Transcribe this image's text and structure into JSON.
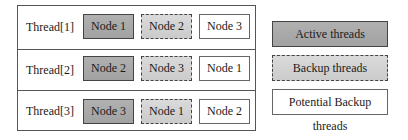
{
  "diagram": {
    "title": "",
    "threads": [
      {
        "label": "Thread[1]",
        "nodes": [
          "Node 1",
          "Node 2",
          "Node 3"
        ]
      },
      {
        "label": "Thread[2]",
        "nodes": [
          "Node 2",
          "Node 3",
          "Node 1"
        ]
      },
      {
        "label": "Thread[3]",
        "nodes": [
          "Node 3",
          "Node 1",
          "Node 2"
        ]
      }
    ],
    "node_roles": [
      "active",
      "backup",
      "potential_backup"
    ],
    "legend": [
      {
        "label": "Active threads",
        "style": "solid-dark-fill"
      },
      {
        "label": "Backup threads",
        "style": "dashed-light-fill"
      },
      {
        "label": "Potential Backup threads",
        "style": "solid-white-fill"
      }
    ],
    "colors": {
      "active_fill": "#a8a8a8",
      "backup_fill": "#d2d2d2",
      "potential_fill": "#ffffff",
      "border": "#444444"
    }
  }
}
